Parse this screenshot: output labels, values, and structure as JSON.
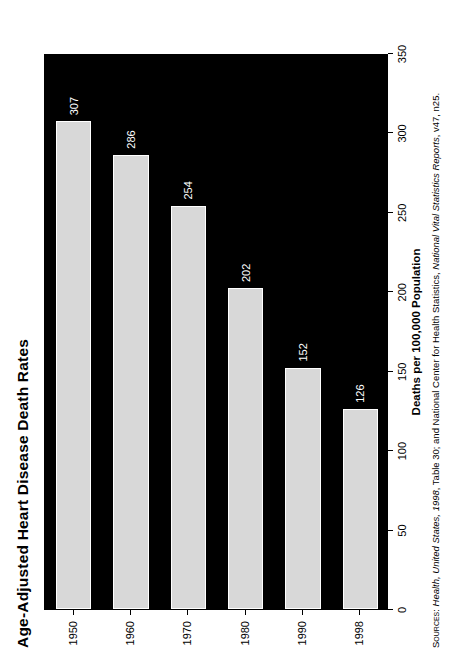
{
  "chart_data": {
    "type": "bar",
    "orientation": "horizontal",
    "title": "Age-Adjusted Heart Disease Death Rates",
    "categories": [
      "1950",
      "1960",
      "1970",
      "1980",
      "1990",
      "1998"
    ],
    "values": [
      307,
      286,
      254,
      202,
      152,
      126
    ],
    "xlabel": "Deaths per 100,000 Population",
    "ylabel": "",
    "xlim": [
      0,
      350
    ],
    "xticks": [
      0,
      50,
      100,
      150,
      200,
      250,
      300,
      350
    ],
    "xtick_labels": [
      "0",
      "50",
      "100",
      "150",
      "200",
      "250",
      "300",
      "350"
    ],
    "grid": false,
    "legend": null,
    "data_labels": [
      "307",
      "286",
      "254",
      "202",
      "152",
      "126"
    ],
    "bar_color": "#d8d8d8",
    "bar_edge_color": "#ffffff",
    "plot_background_color": "#000000",
    "figure_background_color": "#ffffff"
  },
  "source": {
    "prefix": "Sources:",
    "text_1": "Health, United States, 1998",
    "text_2": ", Table 30; and National Center for Health Statistics, ",
    "text_3": "National Vital Statistics Reports",
    "text_4": ", v47, n25.",
    "full": "Sources: Health, United States, 1998, Table 30; and National Center for Health Statistics, National Vital Statistics Reports, v47, n25."
  }
}
